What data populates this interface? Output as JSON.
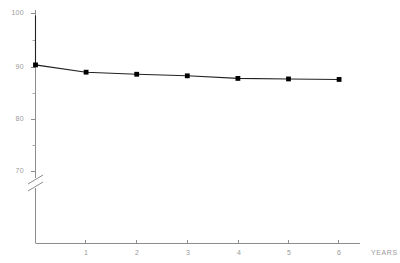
{
  "chart_data": {
    "type": "line",
    "title": "",
    "xlabel": "YEARS",
    "ylabel": "",
    "x": [
      0,
      1,
      2,
      3,
      4,
      5,
      6
    ],
    "values": [
      90.5,
      89.1,
      88.7,
      88.4,
      87.9,
      87.8,
      87.7
    ],
    "start_point": {
      "x": 0,
      "y": 100
    },
    "series": [
      {
        "name": "survival",
        "x": [
          0,
          0,
          1,
          2,
          3,
          4,
          5,
          6
        ],
        "values": [
          100,
          90.5,
          89.1,
          88.7,
          88.4,
          87.9,
          87.8,
          87.7
        ]
      }
    ],
    "xlim": [
      0,
      6.6
    ],
    "ylim": [
      70,
      100
    ],
    "y_ticks": [
      100,
      90,
      80,
      70
    ],
    "y_tick_labels": [
      "100",
      "90",
      "80",
      "70"
    ],
    "y_minor_ticks": [
      95,
      85,
      75
    ],
    "x_ticks": [
      1,
      2,
      3,
      4,
      5,
      6
    ],
    "x_tick_labels": [
      "1",
      "2",
      "3",
      "4",
      "5",
      "6"
    ],
    "grid": false,
    "legend": false,
    "axis_break": true,
    "marker": "filled-square",
    "colors": {
      "line": "#222222",
      "marker": "#000000",
      "axis": "#8c8c8c",
      "tick_label": "#9a9a9a",
      "background": "#ffffff"
    }
  },
  "axis_labels": {
    "y": {
      "t100": "100",
      "t90": "90",
      "t80": "80",
      "t70": "70"
    },
    "x": {
      "t1": "1",
      "t2": "2",
      "t3": "3",
      "t4": "4",
      "t5": "5",
      "t6": "6",
      "title": "YEARS"
    }
  }
}
